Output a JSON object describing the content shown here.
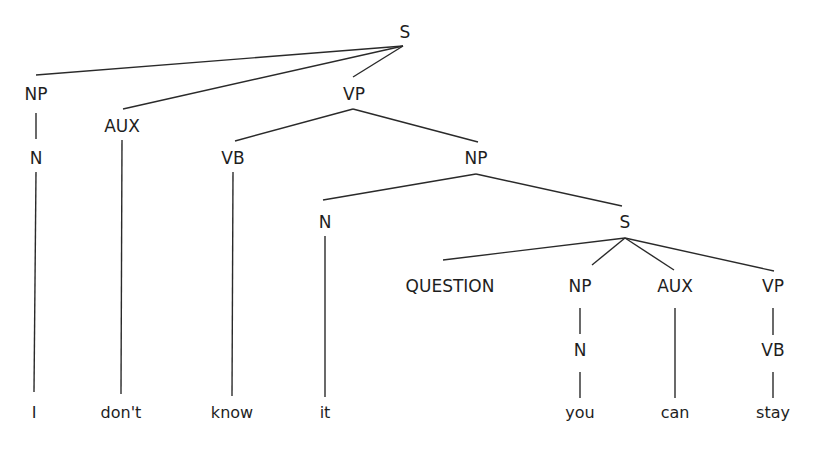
{
  "diagram": {
    "type": "syntax-tree",
    "sentence": "I don't know it you can stay",
    "nodes": [
      {
        "id": "S1",
        "label": "S"
      },
      {
        "id": "NP1",
        "label": "NP"
      },
      {
        "id": "N1",
        "label": "N"
      },
      {
        "id": "AUX1",
        "label": "AUX"
      },
      {
        "id": "VP1",
        "label": "VP"
      },
      {
        "id": "VB1",
        "label": "VB"
      },
      {
        "id": "NP2",
        "label": "NP"
      },
      {
        "id": "N2",
        "label": "N"
      },
      {
        "id": "S2",
        "label": "S"
      },
      {
        "id": "Q",
        "label": "QUESTION"
      },
      {
        "id": "NP3",
        "label": "NP"
      },
      {
        "id": "N3",
        "label": "N"
      },
      {
        "id": "AUX2",
        "label": "AUX"
      },
      {
        "id": "VP2",
        "label": "VP"
      },
      {
        "id": "VB2",
        "label": "VB"
      },
      {
        "id": "w1",
        "label": "I",
        "word": true
      },
      {
        "id": "w2",
        "label": "don't",
        "word": true
      },
      {
        "id": "w3",
        "label": "know",
        "word": true
      },
      {
        "id": "w4",
        "label": "it",
        "word": true
      },
      {
        "id": "w5",
        "label": "you",
        "word": true
      },
      {
        "id": "w6",
        "label": "can",
        "word": true
      },
      {
        "id": "w7",
        "label": "stay",
        "word": true
      }
    ],
    "edges": [
      [
        "S1",
        "NP1"
      ],
      [
        "S1",
        "AUX1"
      ],
      [
        "S1",
        "VP1"
      ],
      [
        "NP1",
        "N1"
      ],
      [
        "N1",
        "w1"
      ],
      [
        "AUX1",
        "w2"
      ],
      [
        "VP1",
        "VB1"
      ],
      [
        "VP1",
        "NP2"
      ],
      [
        "VB1",
        "w3"
      ],
      [
        "NP2",
        "N2"
      ],
      [
        "NP2",
        "S2"
      ],
      [
        "N2",
        "w4"
      ],
      [
        "S2",
        "Q"
      ],
      [
        "S2",
        "NP3"
      ],
      [
        "S2",
        "AUX2"
      ],
      [
        "S2",
        "VP2"
      ],
      [
        "NP3",
        "N3"
      ],
      [
        "N3",
        "w5"
      ],
      [
        "AUX2",
        "w6"
      ],
      [
        "VP2",
        "VB2"
      ],
      [
        "VB2",
        "w7"
      ]
    ]
  }
}
